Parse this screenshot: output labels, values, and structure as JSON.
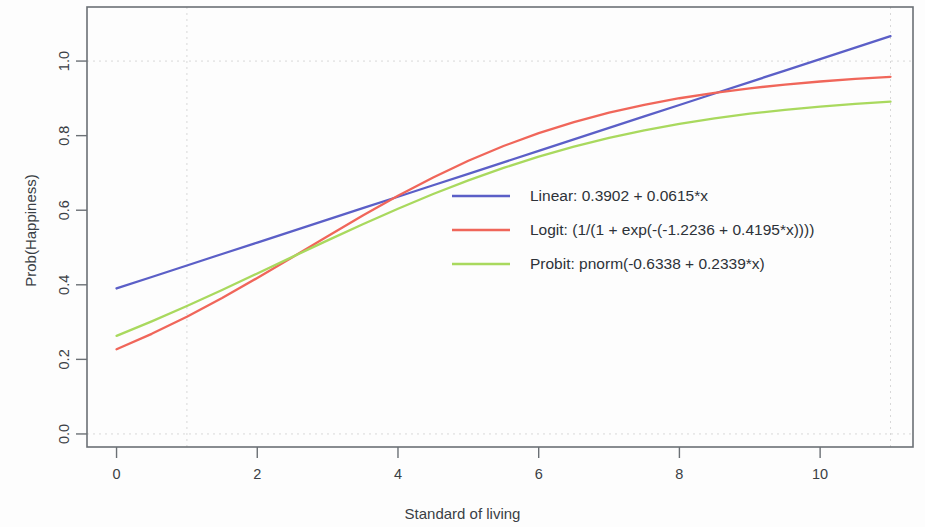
{
  "chart_data": {
    "type": "line",
    "title": "",
    "xlabel": "Standard of living",
    "ylabel": "Prob(Happiness)",
    "xlim": [
      -0.42,
      11.32
    ],
    "ylim": [
      -0.035,
      1.145
    ],
    "xticks": [
      0,
      2,
      4,
      6,
      8,
      10
    ],
    "xtick_labels": [
      "0",
      "2",
      "4",
      "6",
      "8",
      "10"
    ],
    "yticks": [
      0.0,
      0.2,
      0.4,
      0.6,
      0.8,
      1.0
    ],
    "ytick_labels": [
      "0.0",
      "0.2",
      "0.4",
      "0.6",
      "0.8",
      "1.0"
    ],
    "grid": true,
    "grid_horizontal_values": [
      0.0,
      1.0
    ],
    "grid_vertical_values": [
      1,
      11
    ],
    "grid_color": "#d8d8d8",
    "legend_position": "center-right",
    "x": [
      0,
      0.5,
      1,
      1.5,
      2,
      2.5,
      3,
      3.5,
      4,
      4.5,
      5,
      5.5,
      6,
      6.5,
      7,
      7.5,
      8,
      8.5,
      9,
      9.5,
      10,
      10.5,
      11
    ],
    "series": [
      {
        "name": "Linear",
        "label": "Linear: 0.3902 + 0.0615*x",
        "color": "#5b5fc7",
        "formula": "0.3902 + 0.0615*x",
        "values": [
          0.3902,
          0.421,
          0.4517,
          0.4825,
          0.5132,
          0.544,
          0.5747,
          0.6055,
          0.6362,
          0.667,
          0.6977,
          0.7285,
          0.7592,
          0.79,
          0.8207,
          0.8515,
          0.8822,
          0.913,
          0.9437,
          0.9745,
          1.0052,
          1.036,
          1.0667
        ]
      },
      {
        "name": "Logit",
        "label": "Logit: (1/(1 + exp(-(-1.2236 + 0.4195*x))))",
        "color": "#f0665a",
        "formula": "1/(1 + exp(-(-1.2236 + 0.4195*x)))",
        "values": [
          0.2273,
          0.2685,
          0.3145,
          0.3647,
          0.4183,
          0.474,
          0.5303,
          0.5857,
          0.6386,
          0.6878,
          0.7325,
          0.7722,
          0.8068,
          0.8364,
          0.8616,
          0.8827,
          0.9003,
          0.9149,
          0.927,
          0.937,
          0.9452,
          0.9521,
          0.9578
        ]
      },
      {
        "name": "Probit",
        "label": "Probit: pnorm(-0.6338 + 0.2339*x)",
        "color": "#a9d95e",
        "formula": "pnorm(-0.6338 + 0.2339*x)",
        "values": [
          0.2631,
          0.3019,
          0.3431,
          0.3861,
          0.4303,
          0.4749,
          0.5192,
          0.5625,
          0.604,
          0.6434,
          0.6799,
          0.7134,
          0.7436,
          0.7704,
          0.7939,
          0.8143,
          0.8317,
          0.8465,
          0.8589,
          0.8693,
          0.878,
          0.8852,
          0.8911
        ]
      }
    ]
  },
  "legend": {
    "items": [
      {
        "label": "Linear: 0.3902 + 0.0615*x",
        "color": "#5b5fc7"
      },
      {
        "label": "Logit: (1/(1 + exp(-(-1.2236 + 0.4195*x))))",
        "color": "#f0665a"
      },
      {
        "label": "Probit: pnorm(-0.6338 + 0.2339*x)",
        "color": "#a9d95e"
      }
    ]
  }
}
